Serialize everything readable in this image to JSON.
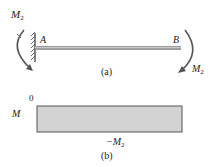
{
  "figure_a": {
    "moment_left_label": "M",
    "moment_left_sub": "2",
    "point_a_label": "A",
    "point_b_label": "B",
    "moment_right_label": "M",
    "moment_right_sub": "2",
    "caption": "(a)"
  },
  "figure_b": {
    "axis_label": "M",
    "zero_label": "0",
    "value_label": "−M",
    "value_sub": "2",
    "caption": "(b)",
    "fill_color": "#d3d3d3",
    "border_color": "#555555"
  },
  "colors": {
    "beam": "#888888",
    "arrow": "#555555",
    "wall_hatch": "#444444"
  }
}
